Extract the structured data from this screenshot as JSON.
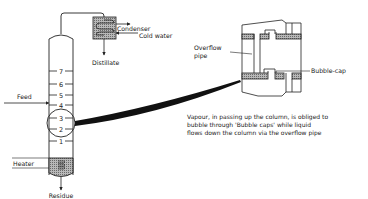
{
  "labels": {
    "condenser": "Condenser",
    "cold_water": "Cold water",
    "distillate": "Distillate",
    "feed": "Feed",
    "heater": "Heater",
    "residue": "Residue",
    "overflow_pipe_line1": "Overflow",
    "overflow_pipe_line2": "pipe",
    "bubble_cap": "Bubble-cap"
  },
  "plates": [
    "1",
    "2",
    "3",
    "4",
    "5",
    "6",
    "7"
  ],
  "caption": {
    "line1": "Vapour, in passing up the column, is obliged to",
    "line2": "bubble through 'Bubble caps' while liquid",
    "line3": "flows down the column via the overflow pipe"
  },
  "colors": {
    "line": "#222222",
    "hatch": "#9a9a9a"
  }
}
